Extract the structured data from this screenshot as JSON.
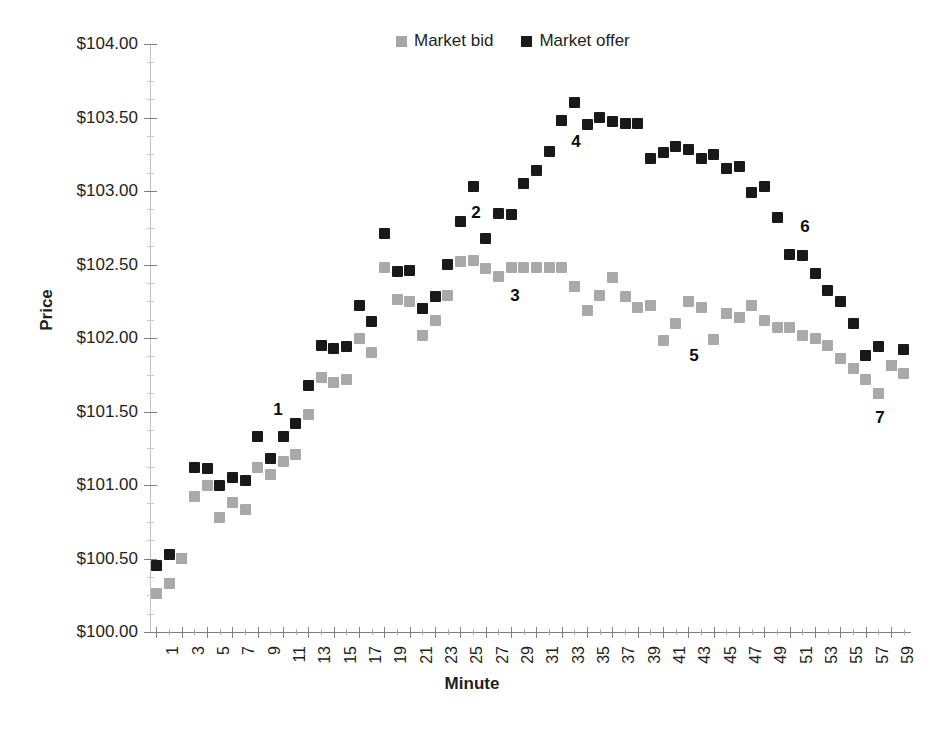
{
  "chart_data": {
    "type": "scatter",
    "title": "",
    "xlabel": "Minute",
    "ylabel": "Price",
    "xlim": [
      0,
      60
    ],
    "ylim": [
      100.0,
      104.0
    ],
    "ytick_labels": [
      "$100.00",
      "$100.50",
      "$101.00",
      "$101.50",
      "$102.00",
      "$102.50",
      "$103.00",
      "$103.50",
      "$104.00"
    ],
    "ytick_values": [
      100.0,
      100.5,
      101.0,
      101.5,
      102.0,
      102.5,
      103.0,
      103.5,
      104.0
    ],
    "xtick_labels": [
      "1",
      "3",
      "5",
      "7",
      "9",
      "11",
      "13",
      "15",
      "17",
      "19",
      "21",
      "23",
      "25",
      "27",
      "29",
      "31",
      "33",
      "35",
      "37",
      "39",
      "41",
      "43",
      "45",
      "47",
      "49",
      "51",
      "53",
      "55",
      "57",
      "59"
    ],
    "xtick_values": [
      1,
      3,
      5,
      7,
      9,
      11,
      13,
      15,
      17,
      19,
      21,
      23,
      25,
      27,
      29,
      31,
      33,
      35,
      37,
      39,
      41,
      43,
      45,
      47,
      49,
      51,
      53,
      55,
      57,
      59
    ],
    "grid": false,
    "legend_position": "top-center",
    "legend": [
      "Market bid",
      "Market offer"
    ],
    "colors": {
      "bid": "#a9a9a9",
      "offer": "#191919"
    },
    "x": [
      1,
      2,
      3,
      4,
      5,
      6,
      7,
      8,
      9,
      10,
      11,
      12,
      13,
      14,
      15,
      16,
      17,
      18,
      19,
      20,
      21,
      22,
      23,
      24,
      25,
      26,
      27,
      28,
      29,
      30,
      31,
      32,
      33,
      34,
      35,
      36,
      37,
      38,
      39,
      40,
      41,
      42,
      43,
      44,
      45,
      46,
      47,
      48,
      49,
      50,
      51,
      52,
      53,
      54,
      55,
      56,
      57,
      58,
      59,
      60
    ],
    "series": [
      {
        "name": "Market offer",
        "color": "#191919",
        "values": [
          100.45,
          100.53,
          100.5,
          101.12,
          101.11,
          101.0,
          101.05,
          101.03,
          101.33,
          101.18,
          101.33,
          101.42,
          101.68,
          101.95,
          101.93,
          101.94,
          102.22,
          102.11,
          102.71,
          102.45,
          102.46,
          102.2,
          102.28,
          102.5,
          102.79,
          103.03,
          102.68,
          102.85,
          102.84,
          103.05,
          103.14,
          103.27,
          103.48,
          103.6,
          103.45,
          103.5,
          103.47,
          103.46,
          103.46,
          103.22,
          103.26,
          103.3,
          103.28,
          103.22,
          103.25,
          103.15,
          103.17,
          102.99,
          103.03,
          102.82,
          102.57,
          102.56,
          102.44,
          102.32,
          102.25,
          102.1,
          101.88,
          101.94,
          101.81,
          101.92
        ]
      },
      {
        "name": "Market bid",
        "color": "#a9a9a9",
        "values": [
          100.26,
          100.33,
          100.5,
          100.92,
          101.0,
          100.78,
          100.88,
          100.83,
          101.12,
          101.07,
          101.16,
          101.21,
          101.48,
          101.73,
          101.7,
          101.72,
          102.0,
          101.9,
          102.48,
          102.26,
          102.25,
          102.02,
          102.12,
          102.29,
          102.52,
          102.53,
          102.47,
          102.42,
          102.48,
          102.48,
          102.48,
          102.48,
          102.48,
          102.35,
          102.19,
          102.29,
          102.41,
          102.28,
          102.21,
          102.22,
          101.98,
          102.1,
          102.25,
          102.21,
          101.99,
          102.17,
          102.14,
          102.22,
          102.12,
          102.07,
          102.07,
          102.02,
          102.0,
          101.95,
          101.86,
          101.79,
          101.72,
          101.62,
          101.81,
          101.76
        ]
      }
    ],
    "annotations": [
      {
        "label": "1",
        "x_px": 278,
        "y_px": 410
      },
      {
        "label": "2",
        "x_px": 476,
        "y_px": 213
      },
      {
        "label": "3",
        "x_px": 515,
        "y_px": 296
      },
      {
        "label": "4",
        "x_px": 576,
        "y_px": 142
      },
      {
        "label": "5",
        "x_px": 694,
        "y_px": 356
      },
      {
        "label": "6",
        "x_px": 805,
        "y_px": 227
      },
      {
        "label": "7",
        "x_px": 880,
        "y_px": 418
      }
    ]
  },
  "legend": {
    "bid_label": "Market bid",
    "offer_label": "Market offer"
  },
  "axes": {
    "y_title": "Price",
    "x_title": "Minute"
  }
}
